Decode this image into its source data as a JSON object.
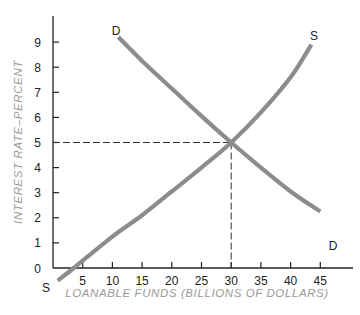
{
  "chart_data": {
    "type": "line",
    "title": "",
    "xlabel": "LOANABLE FUNDS (BILLIONS OF DOLLARS)",
    "ylabel": "INTEREST RATE–PERCENT",
    "xlim": [
      0,
      50
    ],
    "ylim": [
      0,
      10
    ],
    "x_ticks": [
      5,
      10,
      15,
      20,
      25,
      30,
      35,
      40,
      45
    ],
    "x_tick_labels": [
      "5",
      "10",
      "15",
      "20",
      "25",
      "30",
      "35",
      "40",
      "45"
    ],
    "y_ticks": [
      0,
      1,
      2,
      3,
      4,
      5,
      6,
      7,
      8,
      9
    ],
    "y_tick_labels": [
      "0",
      "1",
      "2",
      "3",
      "4",
      "5",
      "6",
      "7",
      "8",
      "9"
    ],
    "grid": false,
    "legend": "none",
    "series": [
      {
        "name": "S",
        "description": "Supply of loanable funds (upward sloping)",
        "start_label": "S",
        "end_label": "S",
        "color": "#8c8c8c",
        "points": [
          [
            0.8,
            -0.5
          ],
          [
            3.5,
            0
          ],
          [
            10,
            1.25
          ],
          [
            15,
            2.1
          ],
          [
            20,
            3.05
          ],
          [
            25,
            4.0
          ],
          [
            30,
            5.0
          ],
          [
            35,
            6.2
          ],
          [
            40,
            7.6
          ],
          [
            43.5,
            8.9
          ]
        ]
      },
      {
        "name": "D",
        "description": "Demand for loanable funds (downward sloping)",
        "start_label": "D",
        "end_label": "D",
        "color": "#8c8c8c",
        "points": [
          [
            11,
            9.2
          ],
          [
            15,
            8.25
          ],
          [
            20,
            7.15
          ],
          [
            25,
            6.05
          ],
          [
            30,
            5.0
          ],
          [
            35,
            4.0
          ],
          [
            40,
            3.05
          ],
          [
            45,
            2.25
          ]
        ]
      }
    ],
    "annotations": [
      {
        "type": "equilibrium",
        "x": 30,
        "y": 5,
        "note": "dashed guide lines from axes to intersection"
      }
    ]
  }
}
